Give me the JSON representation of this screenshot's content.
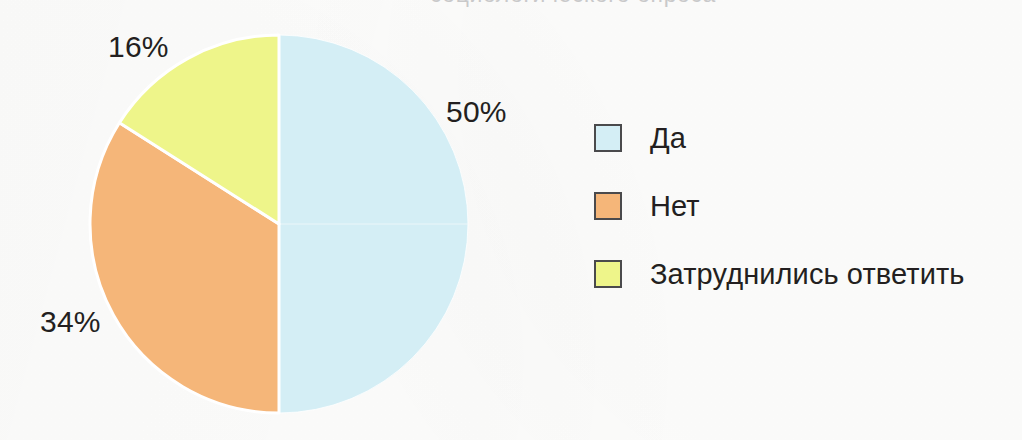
{
  "page": {
    "background_color": "#fdfdfc",
    "title_remnant": "социологического опроса"
  },
  "chart_data": {
    "type": "pie",
    "title": "",
    "subtitle": "",
    "xlabel": "",
    "ylabel": "",
    "grid": false,
    "legend_position": "right",
    "units": "%",
    "total": 100,
    "start_angle_deg": 0,
    "direction": "counterclockwise",
    "categories": [
      "Да",
      "Нет",
      "Затруднились ответить"
    ],
    "values": [
      50,
      34,
      16
    ],
    "labels": [
      "50%",
      "34%",
      "16%"
    ],
    "colors": [
      "#d4eef5",
      "#f5b679",
      "#eef58a"
    ],
    "slice_border_color": "#ffffff",
    "slices": [
      {
        "name": "Да",
        "value": 50,
        "label": "50%",
        "color": "#d4eef5",
        "start_deg": 0,
        "end_deg": 180
      },
      {
        "name": "Нет",
        "value": 34,
        "label": "34%",
        "color": "#f5b679",
        "start_deg": 180,
        "end_deg": 302.4
      },
      {
        "name": "Затруднились ответить",
        "value": 16,
        "label": "16%",
        "color": "#eef58a",
        "start_deg": 302.4,
        "end_deg": 360
      }
    ]
  },
  "legend": {
    "items": [
      {
        "label": "Да",
        "color": "#d4eef5",
        "value": 50
      },
      {
        "label": "Нет",
        "color": "#f5b679",
        "value": 34
      },
      {
        "label": "Затруднились ответить",
        "color": "#eef58a",
        "value": 16
      }
    ]
  },
  "geometry": {
    "center_x": 279,
    "center_y": 224,
    "radius": 189
  }
}
